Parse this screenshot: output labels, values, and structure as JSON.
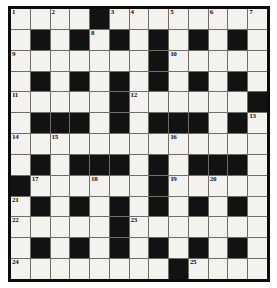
{
  "puzzle": {
    "title": "Crossword Grid",
    "type": "crossword",
    "rows": 13,
    "cols": 13,
    "colors": {
      "block": "#121212",
      "cell": "#f4f2ee",
      "border": "#0b0b0b",
      "gridline": "#6e6e68",
      "number_text": "#111111",
      "page_background": "#ffffff"
    },
    "blocks": [
      [
        0,
        0,
        0,
        0,
        1,
        0,
        0,
        0,
        0,
        0,
        0,
        0,
        0
      ],
      [
        0,
        1,
        0,
        1,
        0,
        1,
        0,
        1,
        0,
        1,
        0,
        1,
        0
      ],
      [
        0,
        0,
        0,
        0,
        0,
        0,
        0,
        1,
        0,
        0,
        0,
        0,
        0
      ],
      [
        0,
        1,
        0,
        1,
        0,
        1,
        0,
        1,
        0,
        1,
        0,
        1,
        0
      ],
      [
        0,
        0,
        0,
        0,
        0,
        1,
        0,
        0,
        0,
        0,
        0,
        0,
        1
      ],
      [
        0,
        1,
        1,
        1,
        0,
        1,
        0,
        1,
        1,
        1,
        0,
        1,
        0
      ],
      [
        0,
        0,
        0,
        0,
        0,
        0,
        0,
        0,
        0,
        0,
        0,
        0,
        0
      ],
      [
        0,
        1,
        0,
        1,
        1,
        1,
        0,
        1,
        0,
        1,
        1,
        1,
        0
      ],
      [
        1,
        0,
        0,
        0,
        0,
        0,
        0,
        1,
        0,
        0,
        0,
        0,
        0
      ],
      [
        0,
        1,
        0,
        1,
        0,
        1,
        0,
        1,
        0,
        1,
        0,
        1,
        0
      ],
      [
        0,
        0,
        0,
        0,
        0,
        1,
        0,
        0,
        0,
        0,
        0,
        0,
        0
      ],
      [
        0,
        1,
        0,
        1,
        0,
        1,
        0,
        1,
        0,
        1,
        0,
        1,
        0
      ],
      [
        0,
        0,
        0,
        0,
        0,
        0,
        0,
        0,
        1,
        0,
        0,
        0,
        0
      ]
    ],
    "numbers": [
      {
        "label": "1",
        "row": 0,
        "col": 0
      },
      {
        "label": "2",
        "row": 0,
        "col": 2
      },
      {
        "label": "3",
        "row": 0,
        "col": 5
      },
      {
        "label": "4",
        "row": 0,
        "col": 6
      },
      {
        "label": "5",
        "row": 0,
        "col": 8
      },
      {
        "label": "6",
        "row": 0,
        "col": 10
      },
      {
        "label": "7",
        "row": 0,
        "col": 12
      },
      {
        "label": "8",
        "row": 1,
        "col": 4
      },
      {
        "label": "9",
        "row": 2,
        "col": 0
      },
      {
        "label": "10",
        "row": 2,
        "col": 8
      },
      {
        "label": "11",
        "row": 4,
        "col": 0
      },
      {
        "label": "12",
        "row": 4,
        "col": 6
      },
      {
        "label": "13",
        "row": 5,
        "col": 12
      },
      {
        "label": "14",
        "row": 6,
        "col": 0
      },
      {
        "label": "15",
        "row": 6,
        "col": 2
      },
      {
        "label": "16",
        "row": 6,
        "col": 8
      },
      {
        "label": "17",
        "row": 8,
        "col": 1
      },
      {
        "label": "18",
        "row": 8,
        "col": 4
      },
      {
        "label": "19",
        "row": 8,
        "col": 8
      },
      {
        "label": "20",
        "row": 8,
        "col": 10
      },
      {
        "label": "21",
        "row": 9,
        "col": 0
      },
      {
        "label": "22",
        "row": 10,
        "col": 0
      },
      {
        "label": "23",
        "row": 10,
        "col": 6
      },
      {
        "label": "24",
        "row": 12,
        "col": 0
      },
      {
        "label": "25",
        "row": 12,
        "col": 9
      }
    ],
    "letters": []
  }
}
